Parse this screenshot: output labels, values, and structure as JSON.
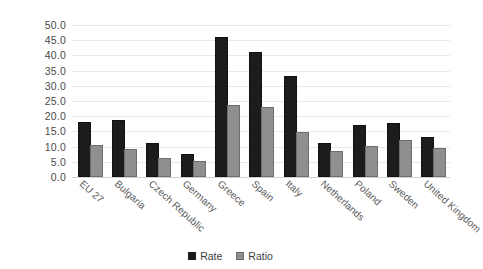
{
  "chart_data": {
    "type": "bar",
    "title": "",
    "subtitle": "",
    "xlabel": "",
    "ylabel": "",
    "ylim": [
      0,
      50
    ],
    "y_ticks": [
      "0.0",
      "5.0",
      "10.0",
      "15.0",
      "20.0",
      "25.0",
      "30.0",
      "35.0",
      "40.0",
      "45.0",
      "50.0"
    ],
    "y_tick_values": [
      0,
      5,
      10,
      15,
      20,
      25,
      30,
      35,
      40,
      45,
      50
    ],
    "grid": true,
    "legend_position": "bottom-center",
    "categories": [
      "EU 27",
      "Bulgaria",
      "Czech Republic",
      "Germany",
      "Greece",
      "Spain",
      "Italy",
      "Netherlands",
      "Poland",
      "Sweden",
      "United Kingdom"
    ],
    "series": [
      {
        "name": "Rate",
        "color": "#1c1c1c",
        "values": [
          17.5,
          18.0,
          10.5,
          7.0,
          45.5,
          40.5,
          32.5,
          10.5,
          16.5,
          17.0,
          12.5
        ]
      },
      {
        "name": "Ratio",
        "color": "#8f8f8f",
        "values": [
          10.0,
          8.5,
          5.5,
          4.5,
          23.0,
          22.5,
          14.0,
          8.0,
          9.5,
          11.5,
          9.0
        ]
      }
    ]
  },
  "legend": {
    "items": [
      {
        "label": "Rate",
        "swatch": "rate"
      },
      {
        "label": "Ratio",
        "swatch": "ratio"
      }
    ]
  }
}
